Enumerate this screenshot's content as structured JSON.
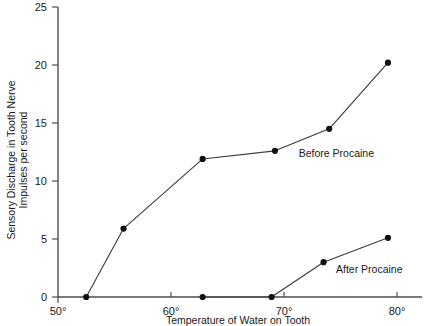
{
  "chart_data": {
    "type": "line",
    "title": "",
    "xlabel": "Temperature of Water on Tooth",
    "ylabel": "Sensory Discharge in Tooth Nerve Impulses per second",
    "ylabel_line1": "Sensory Discharge in Tooth Nerve",
    "ylabel_line2": "Impulses per second",
    "xlim": [
      50,
      82
    ],
    "ylim": [
      0,
      25
    ],
    "grid": false,
    "legend_position": "inline-annotation",
    "x_tick_labels": [
      "50°",
      "60°",
      "70°",
      "80°"
    ],
    "x_tick_values": [
      50,
      60,
      70,
      80
    ],
    "y_tick_labels": [
      "0",
      "5",
      "10",
      "15",
      "20",
      "25"
    ],
    "y_tick_values": [
      0,
      5,
      10,
      15,
      20,
      25
    ],
    "series": [
      {
        "name": "Before Procaine",
        "annotation": "Before Procaine",
        "annotation_x": 71.3,
        "annotation_y": 12.1,
        "x": [
          52.5,
          55.8,
          62.8,
          69.2,
          74.0,
          79.2
        ],
        "y": [
          0.0,
          5.9,
          11.9,
          12.6,
          14.5,
          20.2
        ]
      },
      {
        "name": "After Procaine",
        "annotation": "After Procaine",
        "annotation_x": 74.6,
        "annotation_y": 2.1,
        "x": [
          62.8,
          68.9,
          73.5,
          79.2
        ],
        "y": [
          0.0,
          0.0,
          3.0,
          5.1
        ]
      }
    ],
    "colors": {
      "line": "#3a3a3a",
      "marker": "#111111",
      "axis": "#4d4d4d",
      "text": "#1a1a1a",
      "background": "#ffffff"
    }
  }
}
